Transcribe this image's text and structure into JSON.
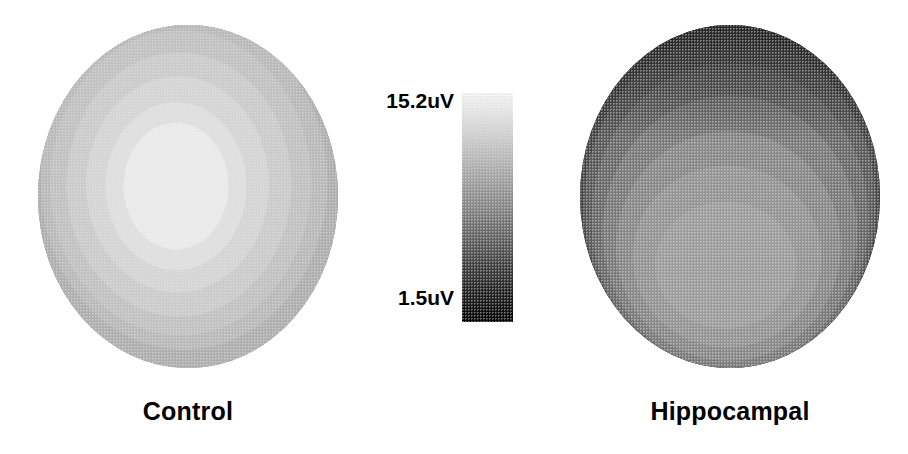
{
  "figure": {
    "type": "eeg-topographic-map-pair",
    "background_color": "#ffffff",
    "modality": "grayscale-contour-topography"
  },
  "colorbar": {
    "name": "amplitude-scale",
    "max_label": "15.2uV",
    "min_label": "1.5uV",
    "max_value": 15.2,
    "min_value": 1.5,
    "unit": "uV",
    "orientation": "vertical",
    "high_end": "top",
    "high_color": "#fdfdfd",
    "low_color": "#050505",
    "x": 462,
    "y": 93,
    "width": 51,
    "height": 229
  },
  "panels": [
    {
      "id": "control",
      "label": "Control",
      "x": 38,
      "y": 25,
      "width": 300,
      "height": 343,
      "label_y": 397,
      "description": "Concentric rings with bright near-white maximum at the center, darkening monotonically toward the rim.",
      "peak_location": "central",
      "peak_value_uv": 14.6,
      "rim_value_uv": 6.5,
      "contours": [
        {
          "level_uv": 14.6,
          "gray": "#f3f3f3",
          "rx": 0.175,
          "ry": 0.185,
          "cx": 0.46,
          "cy": 0.47
        },
        {
          "level_uv": 13.2,
          "gray": "#e6e6e6",
          "rx": 0.235,
          "ry": 0.245,
          "cx": 0.46,
          "cy": 0.47
        },
        {
          "level_uv": 12.0,
          "gray": "#dcdcdc",
          "rx": 0.305,
          "ry": 0.315,
          "cx": 0.465,
          "cy": 0.465
        },
        {
          "level_uv": 10.8,
          "gray": "#d2d2d2",
          "rx": 0.375,
          "ry": 0.385,
          "cx": 0.47,
          "cy": 0.465
        },
        {
          "level_uv": 9.8,
          "gray": "#c8c8c8",
          "rx": 0.435,
          "ry": 0.445,
          "cx": 0.475,
          "cy": 0.46
        },
        {
          "level_uv": 8.8,
          "gray": "#bfbfbf",
          "rx": 0.478,
          "ry": 0.487,
          "cx": 0.487,
          "cy": 0.46
        },
        {
          "level_uv": 7.8,
          "gray": "#b4b4b4",
          "rx": 0.497,
          "ry": 0.5,
          "cx": 0.5,
          "cy": 0.5
        }
      ]
    },
    {
      "id": "hippocampal",
      "label": "Hippocampal",
      "x": 580,
      "y": 25,
      "width": 300,
      "height": 343,
      "label_y": 397,
      "description": "Globally reduced amplitude; dark band across the superior margin with contours displaced inferiorly, mid-gray maximum low and central.",
      "peak_location": "inferior-central",
      "peak_value_uv": 8.4,
      "rim_value_uv": 2.2,
      "contours": [
        {
          "level_uv": 3.2,
          "gray": "#4a4a4a",
          "rx": 0.5,
          "ry": 0.5,
          "cx": 0.5,
          "cy": 0.5
        },
        {
          "level_uv": 4.2,
          "gray": "#5e5e5e",
          "rx": 0.487,
          "ry": 0.492,
          "cx": 0.5,
          "cy": 0.525
        },
        {
          "level_uv": 5.2,
          "gray": "#6e6e6e",
          "rx": 0.462,
          "ry": 0.455,
          "cx": 0.5,
          "cy": 0.565
        },
        {
          "level_uv": 6.2,
          "gray": "#7e7e7e",
          "rx": 0.425,
          "ry": 0.4,
          "cx": 0.5,
          "cy": 0.605
        },
        {
          "level_uv": 7.2,
          "gray": "#8d8d8d",
          "rx": 0.375,
          "ry": 0.335,
          "cx": 0.495,
          "cy": 0.645
        },
        {
          "level_uv": 8.0,
          "gray": "#999999",
          "rx": 0.315,
          "ry": 0.265,
          "cx": 0.49,
          "cy": 0.675
        },
        {
          "level_uv": 8.4,
          "gray": "#a2a2a2",
          "rx": 0.235,
          "ry": 0.185,
          "cx": 0.485,
          "cy": 0.7
        }
      ]
    }
  ],
  "chart_data": {
    "type": "heatmap",
    "title": "",
    "subtitle": "",
    "xlabel": "",
    "ylabel": "",
    "colorbar_label": "uV",
    "colorbar_range": [
      1.5,
      15.2
    ],
    "colormap": "grayscale (white = high, black = low)",
    "legend_position": "center",
    "grid": false,
    "categories": [
      "Control",
      "Hippocampal"
    ],
    "series": [
      {
        "name": "Control",
        "peak_uv": 14.6,
        "min_uv": 6.5,
        "contour_levels_uv": [
          14.6,
          13.2,
          12.0,
          10.8,
          9.8,
          8.8,
          7.8
        ],
        "peak_location": "central"
      },
      {
        "name": "Hippocampal",
        "peak_uv": 8.4,
        "min_uv": 2.2,
        "contour_levels_uv": [
          8.4,
          8.0,
          7.2,
          6.2,
          5.2,
          4.2,
          3.2
        ],
        "peak_location": "inferior-central"
      }
    ]
  }
}
